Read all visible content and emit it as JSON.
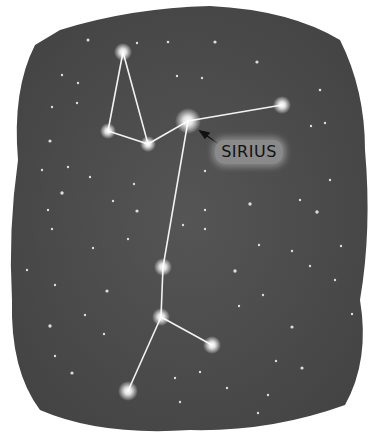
{
  "label": "SIRIUS",
  "colors": {
    "sky": "#4a4a4a",
    "star": "#ffffff",
    "line": "#f2f2f2",
    "label_bg": "#8a8a8a"
  },
  "stars_major": [
    {
      "name": "top",
      "x": 123,
      "y": 52
    },
    {
      "name": "left",
      "x": 108,
      "y": 131
    },
    {
      "name": "mid",
      "x": 148,
      "y": 144
    },
    {
      "name": "sirius",
      "x": 188,
      "y": 121
    },
    {
      "name": "right",
      "x": 282,
      "y": 105
    },
    {
      "name": "lower1",
      "x": 163,
      "y": 267
    },
    {
      "name": "lower2",
      "x": 161,
      "y": 317
    },
    {
      "name": "lower-right",
      "x": 212,
      "y": 345
    },
    {
      "name": "bottom",
      "x": 128,
      "y": 391
    }
  ]
}
